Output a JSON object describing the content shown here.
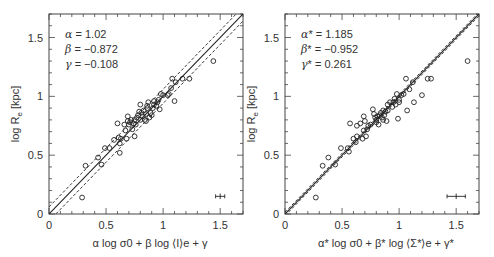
{
  "chart_data": [
    {
      "type": "scatter",
      "panel": "left",
      "xlabel": "α log σ0 + β log ⟨I⟩e + γ",
      "ylabel": "log Re [kpc]",
      "xlim": [
        0,
        1.7
      ],
      "ylim": [
        0,
        1.7
      ],
      "xticks": [
        "0",
        "0.5",
        "1",
        "1.5"
      ],
      "yticks": [
        "0",
        "0.5",
        "1",
        "1.5"
      ],
      "grid": false,
      "annotations": [
        {
          "symbol": "α",
          "text": " = 1.02"
        },
        {
          "symbol": "β",
          "text": " = −0.872"
        },
        {
          "symbol": "γ",
          "text": " = −0.108"
        }
      ],
      "fit_line": {
        "style": "solid",
        "slope": 1,
        "intercept": 0
      },
      "scatter_lines": [
        {
          "style": "dashed",
          "slope": 1,
          "intercept": 0.06
        },
        {
          "style": "dashed",
          "slope": 1,
          "intercept": -0.06
        }
      ],
      "error_bar": {
        "x": 1.5,
        "y": 0.15,
        "xerr": 0.04,
        "yerr": 0.015
      },
      "points": [
        [
          0.29,
          0.14
        ],
        [
          0.32,
          0.41
        ],
        [
          0.43,
          0.48
        ],
        [
          0.46,
          0.42
        ],
        [
          0.49,
          0.56
        ],
        [
          0.53,
          0.56
        ],
        [
          0.6,
          0.77
        ],
        [
          0.61,
          0.65
        ],
        [
          0.62,
          0.52
        ],
        [
          0.62,
          0.6
        ],
        [
          0.63,
          0.64
        ],
        [
          0.66,
          0.76
        ],
        [
          0.67,
          0.71
        ],
        [
          0.68,
          0.64
        ],
        [
          0.69,
          0.83
        ],
        [
          0.69,
          0.79
        ],
        [
          0.7,
          0.76
        ],
        [
          0.71,
          0.78
        ],
        [
          0.72,
          0.8
        ],
        [
          0.73,
          0.72
        ],
        [
          0.74,
          0.77
        ],
        [
          0.75,
          0.8
        ],
        [
          0.75,
          0.66
        ],
        [
          0.76,
          0.76
        ],
        [
          0.77,
          0.82
        ],
        [
          0.78,
          0.84
        ],
        [
          0.79,
          0.87
        ],
        [
          0.8,
          0.8
        ],
        [
          0.81,
          0.86
        ],
        [
          0.82,
          0.83
        ],
        [
          0.83,
          0.88
        ],
        [
          0.84,
          0.8
        ],
        [
          0.85,
          0.79
        ],
        [
          0.85,
          0.85
        ],
        [
          0.86,
          0.9
        ],
        [
          0.87,
          0.95
        ],
        [
          0.88,
          0.82
        ],
        [
          0.89,
          0.86
        ],
        [
          0.9,
          0.84
        ],
        [
          0.91,
          0.9
        ],
        [
          0.92,
          0.96
        ],
        [
          0.94,
          0.92
        ],
        [
          0.95,
          0.95
        ],
        [
          0.96,
          0.97
        ],
        [
          0.97,
          0.89
        ],
        [
          0.98,
          1.02
        ],
        [
          1.0,
          1.01
        ],
        [
          1.04,
          1.01
        ],
        [
          1.05,
          1.02
        ],
        [
          1.07,
          1.07
        ],
        [
          1.08,
          1.15
        ],
        [
          1.1,
          0.96
        ],
        [
          1.11,
          1.12
        ],
        [
          1.17,
          1.15
        ],
        [
          1.23,
          1.15
        ],
        [
          1.44,
          1.3
        ],
        [
          0.57,
          0.63
        ],
        [
          0.8,
          0.93
        ],
        [
          0.86,
          0.92
        ],
        [
          0.92,
          0.93
        ]
      ]
    },
    {
      "type": "scatter",
      "panel": "right",
      "xlabel": "α* log σ0 + β* log ⟨Σ*⟩e + γ*",
      "ylabel": "log Re [kpc]",
      "xlim": [
        0,
        1.7
      ],
      "ylim": [
        0,
        1.7
      ],
      "xticks": [
        "0",
        "0.5",
        "1",
        "1.5"
      ],
      "yticks": [
        "0",
        "0.5",
        "1",
        "1.5"
      ],
      "grid": false,
      "annotations": [
        {
          "symbol": "α",
          "text": "* = 1.185"
        },
        {
          "symbol": "β",
          "text": "* = −0.952"
        },
        {
          "symbol": "γ",
          "text": "* = 0.261"
        }
      ],
      "fit_line": {
        "style": "solid",
        "slope": 1,
        "intercept": 0
      },
      "scatter_lines": [
        {
          "style": "dashed",
          "slope": 1,
          "intercept": 0.015
        },
        {
          "style": "dashed",
          "slope": 1,
          "intercept": -0.015
        }
      ],
      "error_bar": {
        "x": 1.5,
        "y": 0.15,
        "xerr": 0.08,
        "yerr": 0.015
      },
      "points": [
        [
          0.27,
          0.14
        ],
        [
          0.33,
          0.41
        ],
        [
          0.38,
          0.48
        ],
        [
          0.44,
          0.42
        ],
        [
          0.49,
          0.56
        ],
        [
          0.55,
          0.56
        ],
        [
          0.56,
          0.53
        ],
        [
          0.57,
          0.77
        ],
        [
          0.6,
          0.64
        ],
        [
          0.62,
          0.61
        ],
        [
          0.63,
          0.66
        ],
        [
          0.63,
          0.75
        ],
        [
          0.66,
          0.77
        ],
        [
          0.68,
          0.64
        ],
        [
          0.69,
          0.71
        ],
        [
          0.69,
          0.83
        ],
        [
          0.7,
          0.79
        ],
        [
          0.71,
          0.66
        ],
        [
          0.72,
          0.72
        ],
        [
          0.73,
          0.75
        ],
        [
          0.75,
          0.76
        ],
        [
          0.77,
          0.89
        ],
        [
          0.78,
          0.85
        ],
        [
          0.79,
          0.82
        ],
        [
          0.8,
          0.8
        ],
        [
          0.81,
          0.83
        ],
        [
          0.82,
          0.76
        ],
        [
          0.83,
          0.84
        ],
        [
          0.84,
          0.86
        ],
        [
          0.85,
          0.82
        ],
        [
          0.86,
          0.88
        ],
        [
          0.87,
          0.84
        ],
        [
          0.88,
          0.87
        ],
        [
          0.89,
          0.79
        ],
        [
          0.9,
          0.88
        ],
        [
          0.92,
          0.95
        ],
        [
          0.94,
          0.91
        ],
        [
          0.95,
          0.95
        ],
        [
          0.97,
          0.93
        ],
        [
          0.98,
          1.02
        ],
        [
          0.99,
          0.81
        ],
        [
          1.0,
          0.97
        ],
        [
          1.02,
          1.01
        ],
        [
          1.04,
          1.02
        ],
        [
          1.06,
          1.15
        ],
        [
          1.07,
          0.88
        ],
        [
          1.09,
          1.06
        ],
        [
          1.12,
          1.12
        ],
        [
          1.13,
          0.95
        ],
        [
          1.2,
          1.01
        ],
        [
          1.25,
          1.15
        ],
        [
          1.28,
          1.15
        ],
        [
          1.6,
          1.3
        ],
        [
          0.86,
          0.8
        ],
        [
          0.9,
          0.93
        ],
        [
          0.96,
          0.98
        ],
        [
          1.0,
          0.95
        ],
        [
          0.8,
          0.78
        ]
      ]
    }
  ],
  "panels": [
    {
      "ylabel_text": "log R",
      "ylabel_sub": "e",
      "ylabel_unit": " [kpc]"
    },
    {
      "ylabel_text": "log R",
      "ylabel_sub": "e",
      "ylabel_unit": " [kpc]"
    }
  ]
}
